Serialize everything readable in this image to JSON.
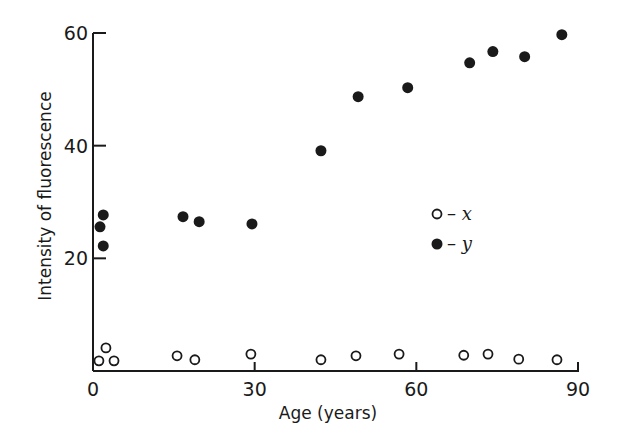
{
  "chart_data": {
    "type": "scatter",
    "title": "",
    "xlabel": "Age (years)",
    "ylabel": "Intensity of fluorescence",
    "xlim": [
      0,
      90
    ],
    "ylim": [
      0,
      60
    ],
    "xticks": [
      0,
      30,
      60,
      90
    ],
    "yticks": [
      20,
      40,
      60
    ],
    "xtick_labels": [
      "0",
      "30",
      "60",
      "90"
    ],
    "ytick_labels": [
      "20",
      "40",
      "60"
    ],
    "grid": false,
    "legend_position": "right-middle",
    "series": [
      {
        "name": "x",
        "legend_label": "– x",
        "marker": "open-circle",
        "points": [
          [
            1.1,
            1.8
          ],
          [
            2.4,
            4.1
          ],
          [
            3.9,
            1.8
          ],
          [
            15.6,
            2.7
          ],
          [
            18.9,
            2.0
          ],
          [
            29.3,
            3.0
          ],
          [
            42.3,
            2.0
          ],
          [
            48.8,
            2.7
          ],
          [
            56.8,
            3.0
          ],
          [
            68.8,
            2.8
          ],
          [
            73.3,
            3.0
          ],
          [
            79.0,
            2.1
          ],
          [
            86.1,
            2.0
          ]
        ]
      },
      {
        "name": "y",
        "legend_label": "– y",
        "marker": "filled-circle",
        "points": [
          [
            1.3,
            25.6
          ],
          [
            1.9,
            27.7
          ],
          [
            1.9,
            22.2
          ],
          [
            16.7,
            27.4
          ],
          [
            19.7,
            26.5
          ],
          [
            29.5,
            26.1
          ],
          [
            42.3,
            39.1
          ],
          [
            49.2,
            48.7
          ],
          [
            58.4,
            50.3
          ],
          [
            69.9,
            54.7
          ],
          [
            74.2,
            56.7
          ],
          [
            80.1,
            55.8
          ],
          [
            87.0,
            59.7
          ]
        ]
      }
    ]
  },
  "colors": {
    "ink": "#1a1a1a",
    "background": "#ffffff"
  }
}
